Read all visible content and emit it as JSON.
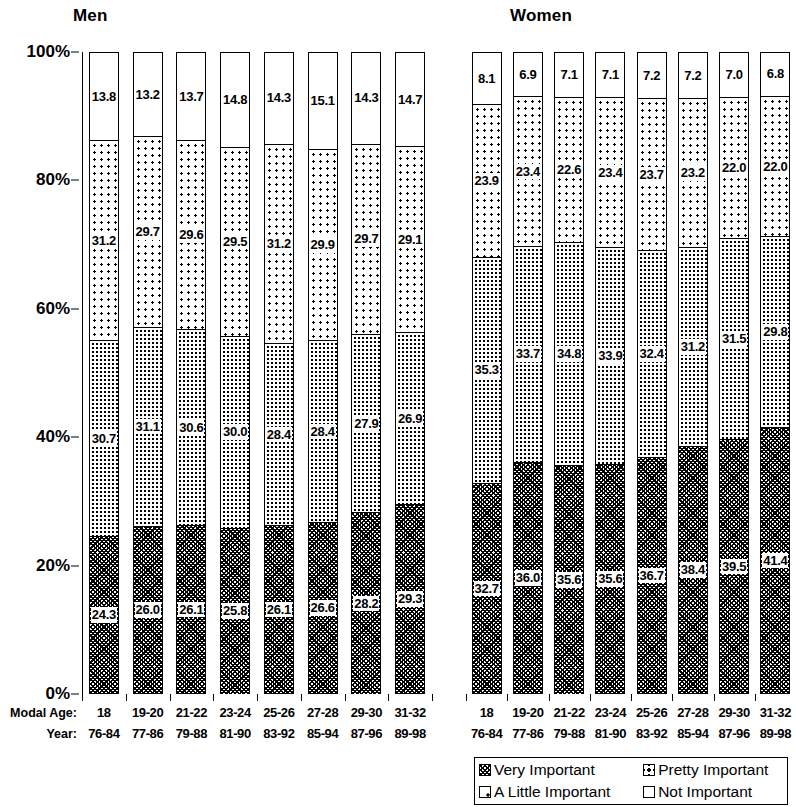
{
  "panels": {
    "men": {
      "title": "Men"
    },
    "women": {
      "title": "Women"
    }
  },
  "axis": {
    "y_ticks": [
      "100%",
      "80%",
      "60%",
      "40%",
      "20%",
      "0%"
    ],
    "row_title_modal_age": "Modal Age:",
    "row_title_year": "Year:"
  },
  "legend": {
    "items": [
      {
        "label": "Very Important",
        "pattern": "p-very"
      },
      {
        "label": "Pretty Important",
        "pattern": "p-pretty"
      },
      {
        "label": "A Little Important",
        "pattern": "p-little"
      },
      {
        "label": "Not Important",
        "pattern": "p-none"
      }
    ]
  },
  "chart_data": {
    "type": "bar",
    "subtype": "100% stacked bar",
    "title": "",
    "xlabel": "Modal Age / Year",
    "ylabel": "",
    "ylim": [
      0,
      100
    ],
    "ytick_labels": [
      "0%",
      "20%",
      "40%",
      "60%",
      "80%",
      "100%"
    ],
    "grid": false,
    "legend_position": "bottom-right",
    "categories": [
      "18",
      "19-20",
      "21-22",
      "23-24",
      "25-26",
      "27-28",
      "29-30",
      "31-32"
    ],
    "categories_year": [
      "76-84",
      "77-86",
      "79-88",
      "81-90",
      "83-92",
      "85-94",
      "87-96",
      "89-98"
    ],
    "panels": [
      {
        "name": "Men",
        "series": [
          {
            "name": "Very Important",
            "values": [
              24.3,
              26.0,
              26.1,
              25.8,
              26.1,
              26.6,
              28.2,
              29.3
            ]
          },
          {
            "name": "Pretty Important",
            "values": [
              30.7,
              31.1,
              30.6,
              30.0,
              28.4,
              28.4,
              27.9,
              26.9
            ]
          },
          {
            "name": "A Little Important",
            "values": [
              31.2,
              29.7,
              29.6,
              29.5,
              31.2,
              29.9,
              29.7,
              29.1
            ]
          },
          {
            "name": "Not Important",
            "values": [
              13.8,
              13.2,
              13.7,
              14.8,
              14.3,
              15.1,
              14.3,
              14.7
            ]
          }
        ]
      },
      {
        "name": "Women",
        "series": [
          {
            "name": "Very Important",
            "values": [
              32.7,
              36.0,
              35.6,
              35.6,
              36.7,
              38.4,
              39.5,
              41.4
            ]
          },
          {
            "name": "Pretty Important",
            "values": [
              35.3,
              33.7,
              34.8,
              33.9,
              32.4,
              31.2,
              31.5,
              29.8
            ]
          },
          {
            "name": "A Little Important",
            "values": [
              23.9,
              23.4,
              22.6,
              23.4,
              23.7,
              23.2,
              22.0,
              22.0
            ]
          },
          {
            "name": "Not Important",
            "values": [
              8.1,
              6.9,
              7.1,
              7.1,
              7.2,
              7.2,
              7.0,
              6.8
            ]
          }
        ]
      }
    ]
  }
}
